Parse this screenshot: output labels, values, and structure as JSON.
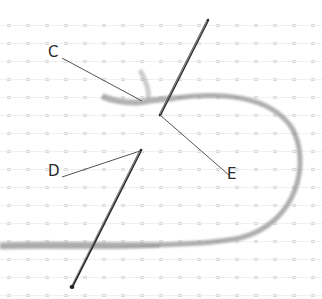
{
  "diagram": {
    "type": "embroidery-stitch-illustration",
    "labels": [
      {
        "id": "C",
        "text": "C",
        "x": 48,
        "y": 45,
        "line_from": [
          62,
          58
        ],
        "line_to": [
          142,
          101
        ]
      },
      {
        "id": "D",
        "text": "D",
        "x": 48,
        "y": 164,
        "line_from": [
          62,
          177
        ],
        "line_to": [
          140,
          151
        ]
      },
      {
        "id": "E",
        "text": "E",
        "x": 227,
        "y": 167,
        "line_from": [
          230,
          176
        ],
        "line_to": [
          160,
          115
        ]
      }
    ],
    "colors": {
      "background": "#ffffff",
      "fabric_dots": "#cfcfcf",
      "thread": "#9a9a9a",
      "needle": "#333333",
      "leader_line": "#555555",
      "label_text": "#2a2a2a"
    }
  }
}
